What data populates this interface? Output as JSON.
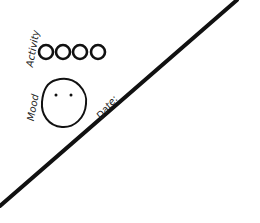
{
  "sketch": {
    "activity_label": "Activity",
    "mood_label": "Mood",
    "date_label": "Date:",
    "activity_circles": 4,
    "mood_face": "neutral face with two dot eyes, no mouth",
    "stroke_color": "#111111",
    "background_color": "#ffffff"
  }
}
